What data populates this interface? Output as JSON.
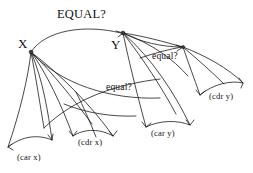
{
  "figure": {
    "title": "EQUAL?",
    "caption_text": "EQUAL?",
    "background_color": "#ffffff",
    "ink_color": "#1a1a1a",
    "node_dot_color": "#3a3a3a"
  },
  "nodes": [
    {
      "id": "x",
      "label": "X",
      "x": 18,
      "y": 37
    },
    {
      "id": "y",
      "label": "Y",
      "x": 111,
      "y": 38
    }
  ],
  "edge_labels": [
    {
      "id": "equal-upper",
      "label": "equal?",
      "x": 152,
      "y": 52
    },
    {
      "id": "equal-lower",
      "label": "equal?",
      "x": 106,
      "y": 83
    }
  ],
  "leaves": [
    {
      "id": "car-x",
      "label": "(car x)",
      "x": 17,
      "y": 153
    },
    {
      "id": "cdr-x",
      "label": "(cdr x)",
      "x": 78,
      "y": 138
    },
    {
      "id": "car-y",
      "label": "(car y)",
      "x": 151,
      "y": 129
    },
    {
      "id": "cdr-y",
      "label": "(cdr y)",
      "x": 209,
      "y": 92
    }
  ]
}
